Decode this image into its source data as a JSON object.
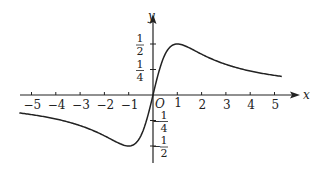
{
  "chart_data": {
    "type": "line",
    "title": "",
    "function": "y = x/(x^2+1)",
    "xlabel": "x",
    "ylabel": "y",
    "origin_label": "O",
    "xlim": [
      -5.5,
      5.8
    ],
    "ylim": [
      -0.6,
      0.65
    ],
    "x_ticks": [
      -5,
      -4,
      -3,
      -2,
      -1,
      1,
      2,
      3,
      4,
      5
    ],
    "x_tick_labels": [
      "−5",
      "−4",
      "−3",
      "−2",
      "−1",
      "1",
      "2",
      "3",
      "4",
      "5"
    ],
    "y_ticks": [
      0.5,
      0.25,
      -0.25,
      -0.5
    ],
    "y_tick_labels": [
      {
        "sign": "",
        "num": "1",
        "den": "2"
      },
      {
        "sign": "",
        "num": "1",
        "den": "4"
      },
      {
        "sign": "−",
        "num": "1",
        "den": "4"
      },
      {
        "sign": "−",
        "num": "1",
        "den": "2"
      }
    ],
    "grid": false,
    "legend": null,
    "series": [
      {
        "name": "f(x)",
        "x": [
          -5.3,
          -5,
          -4,
          -3,
          -2,
          -1.5,
          -1,
          -0.5,
          0,
          0.5,
          1,
          1.5,
          2,
          3,
          4,
          5
        ],
        "values": [
          -0.18,
          -0.19,
          -0.24,
          -0.3,
          -0.4,
          -0.46,
          -0.5,
          -0.4,
          0,
          0.4,
          0.5,
          0.46,
          0.4,
          0.3,
          0.24,
          0.19
        ]
      }
    ],
    "features": {
      "max": {
        "x": 1,
        "y": 0.5
      },
      "min": {
        "x": -1,
        "y": -0.5
      }
    }
  }
}
